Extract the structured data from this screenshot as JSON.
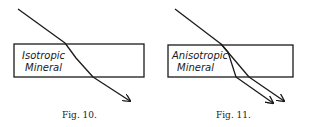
{
  "figures": [
    {
      "caption": "Fig. 10.",
      "label_line1": "Isotropic",
      "label_line2": "Mineral",
      "type": "single refraction"
    },
    {
      "caption": "Fig. 11.",
      "label_line1": "Anisotropic",
      "label_line2": "Mineral",
      "type": "double refraction"
    }
  ],
  "colors": {
    "ink": "#1a1a1a",
    "background": "#ffffff"
  }
}
